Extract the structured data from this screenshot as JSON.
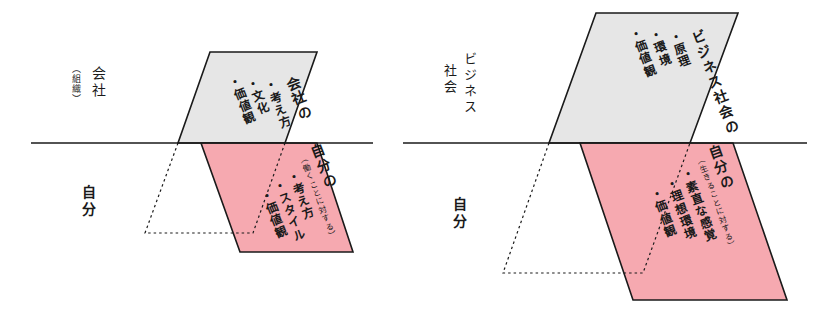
{
  "colors": {
    "gray_plane": "#e6e6e6",
    "pink_plane": "#f6a9b0",
    "stroke": "#1a1a1a",
    "background": "#ffffff"
  },
  "left_diagram": {
    "upper_side_label": {
      "main": "会社",
      "sub": "（組織）"
    },
    "lower_side_label": "自分",
    "gray_plane": {
      "title": "会社の",
      "items": [
        "・考え方",
        "・文化",
        "・価値観"
      ]
    },
    "pink_plane": {
      "title": "自分の",
      "subtitle": "（働くことに対する）",
      "items": [
        "・考え方",
        "・スタイル",
        "・価値観"
      ]
    }
  },
  "right_diagram": {
    "upper_side_label": {
      "line1": "ビジネス",
      "line2": "社会"
    },
    "lower_side_label": "自分",
    "gray_plane": {
      "title": "ビジネス社会の",
      "items": [
        "・原理",
        "・環境",
        "・価値観"
      ]
    },
    "pink_plane": {
      "title": "自分の",
      "subtitle": "（生きることに対する）",
      "items": [
        "・素直な感覚",
        "・理想環境",
        "・価値観"
      ]
    }
  }
}
